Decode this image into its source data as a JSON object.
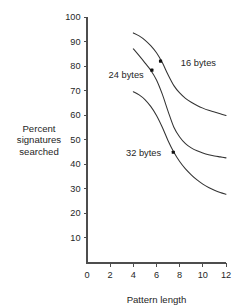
{
  "chart_data": {
    "type": "line",
    "title": "",
    "subtitle": "",
    "xlabel": "Pattern length",
    "ylabel": "Percent signatures searched",
    "ylabel_lines": [
      "Percent",
      "signatures",
      "searched"
    ],
    "xlim": [
      0,
      12
    ],
    "ylim": [
      0,
      100
    ],
    "xticks": [
      0,
      2,
      4,
      6,
      8,
      10,
      12
    ],
    "xtick_labels": [
      "0",
      "2",
      "4",
      "6",
      "8",
      "10",
      "12"
    ],
    "yticks": [
      10,
      20,
      30,
      40,
      50,
      60,
      70,
      80,
      90,
      100
    ],
    "ytick_labels": [
      "10",
      "20",
      "30",
      "40",
      "50",
      "60",
      "70",
      "80",
      "90",
      "100"
    ],
    "grid": false,
    "legend_position": "inline-annotations",
    "series": [
      {
        "name": "16 bytes",
        "label": "16 bytes",
        "label_x": 8.1,
        "label_y": 81.5,
        "marker_x": 6.35,
        "marker_y": 82.0,
        "x": [
          4.0,
          4.5,
          5.0,
          5.5,
          6.0,
          6.5,
          7.0,
          7.5,
          8.0,
          8.5,
          9.0,
          9.5,
          10.0,
          10.5,
          11.0,
          11.5,
          12.0
        ],
        "values": [
          93.5,
          92.3,
          90.6,
          88.3,
          85.4,
          81.4,
          76.4,
          72.0,
          69.0,
          66.8,
          65.2,
          63.9,
          62.8,
          61.9,
          61.2,
          60.5,
          59.8
        ]
      },
      {
        "name": "24 bytes",
        "label": "24 bytes",
        "label_x": 4.9,
        "label_y": 76.5,
        "marker_x": 5.6,
        "marker_y": 78.3,
        "x": [
          4.0,
          4.5,
          5.0,
          5.5,
          6.0,
          6.5,
          7.0,
          7.5,
          8.0,
          8.5,
          9.0,
          9.5,
          10.0,
          10.5,
          11.0,
          11.5,
          12.0
        ],
        "values": [
          87.0,
          84.2,
          81.3,
          78.3,
          74.3,
          68.5,
          61.5,
          55.0,
          51.0,
          48.3,
          46.6,
          45.4,
          44.5,
          43.8,
          43.3,
          42.9,
          42.5
        ]
      },
      {
        "name": "32 bytes",
        "label": "32 bytes",
        "label_x": 6.4,
        "label_y": 44.5,
        "marker_x": 7.45,
        "marker_y": 44.8,
        "x": [
          4.0,
          4.5,
          5.0,
          5.5,
          6.0,
          6.5,
          7.0,
          7.5,
          8.0,
          8.5,
          9.0,
          9.5,
          10.0,
          10.5,
          11.0,
          11.5,
          12.0
        ],
        "values": [
          69.5,
          68.2,
          66.3,
          63.5,
          59.8,
          55.0,
          49.5,
          44.8,
          41.0,
          38.0,
          35.6,
          33.5,
          31.8,
          30.4,
          29.3,
          28.4,
          27.7
        ]
      }
    ],
    "colors": {
      "curve": "#333333",
      "axis": "#4d4d4d",
      "text": "#262626",
      "marker": "#111111",
      "background": "#ffffff"
    }
  }
}
